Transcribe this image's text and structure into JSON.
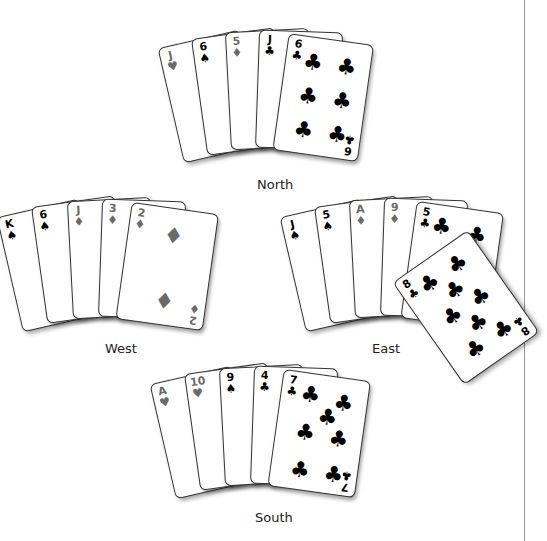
{
  "hands": {
    "north": {
      "label": "North",
      "cards": [
        {
          "rank": "J",
          "suit": "♥",
          "color": "red"
        },
        {
          "rank": "6",
          "suit": "♠",
          "color": "black"
        },
        {
          "rank": "5",
          "suit": "♦",
          "color": "red"
        },
        {
          "rank": "J",
          "suit": "♣",
          "color": "black"
        },
        {
          "rank": "6",
          "suit": "♣",
          "color": "black"
        }
      ]
    },
    "west": {
      "label": "West",
      "cards": [
        {
          "rank": "K",
          "suit": "♠",
          "color": "black"
        },
        {
          "rank": "6",
          "suit": "♠",
          "color": "black"
        },
        {
          "rank": "J",
          "suit": "♦",
          "color": "red"
        },
        {
          "rank": "3",
          "suit": "♦",
          "color": "red"
        },
        {
          "rank": "2",
          "suit": "♦",
          "color": "red"
        }
      ]
    },
    "east": {
      "label": "East",
      "cards": [
        {
          "rank": "J",
          "suit": "♠",
          "color": "black"
        },
        {
          "rank": "5",
          "suit": "♠",
          "color": "black"
        },
        {
          "rank": "A",
          "suit": "♦",
          "color": "red"
        },
        {
          "rank": "9",
          "suit": "♦",
          "color": "red"
        },
        {
          "rank": "5",
          "suit": "♣",
          "color": "black"
        }
      ],
      "played_card": {
        "rank": "8",
        "suit": "♣",
        "color": "black"
      }
    },
    "south": {
      "label": "South",
      "cards": [
        {
          "rank": "A",
          "suit": "♥",
          "color": "red"
        },
        {
          "rank": "10",
          "suit": "♥",
          "color": "red"
        },
        {
          "rank": "9",
          "suit": "♠",
          "color": "black"
        },
        {
          "rank": "4",
          "suit": "♣",
          "color": "black"
        },
        {
          "rank": "7",
          "suit": "♣",
          "color": "black"
        }
      ]
    }
  },
  "colors": {
    "red_suit": "#6a6a6a",
    "black_suit": "#000000",
    "divider": "#9a9a9a"
  }
}
